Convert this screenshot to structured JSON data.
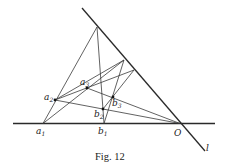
{
  "figure": {
    "caption": "Fig. 12",
    "labels": {
      "a1": {
        "base": "a",
        "sub": "1"
      },
      "a2": {
        "base": "a",
        "sub": "2"
      },
      "a3": {
        "base": "a",
        "sub": "3"
      },
      "b1": {
        "base": "b",
        "sub": "1"
      },
      "b2": {
        "base": "b",
        "sub": "2"
      },
      "b3": {
        "base": "b",
        "sub": "3"
      },
      "O": "O",
      "l": "l"
    }
  }
}
